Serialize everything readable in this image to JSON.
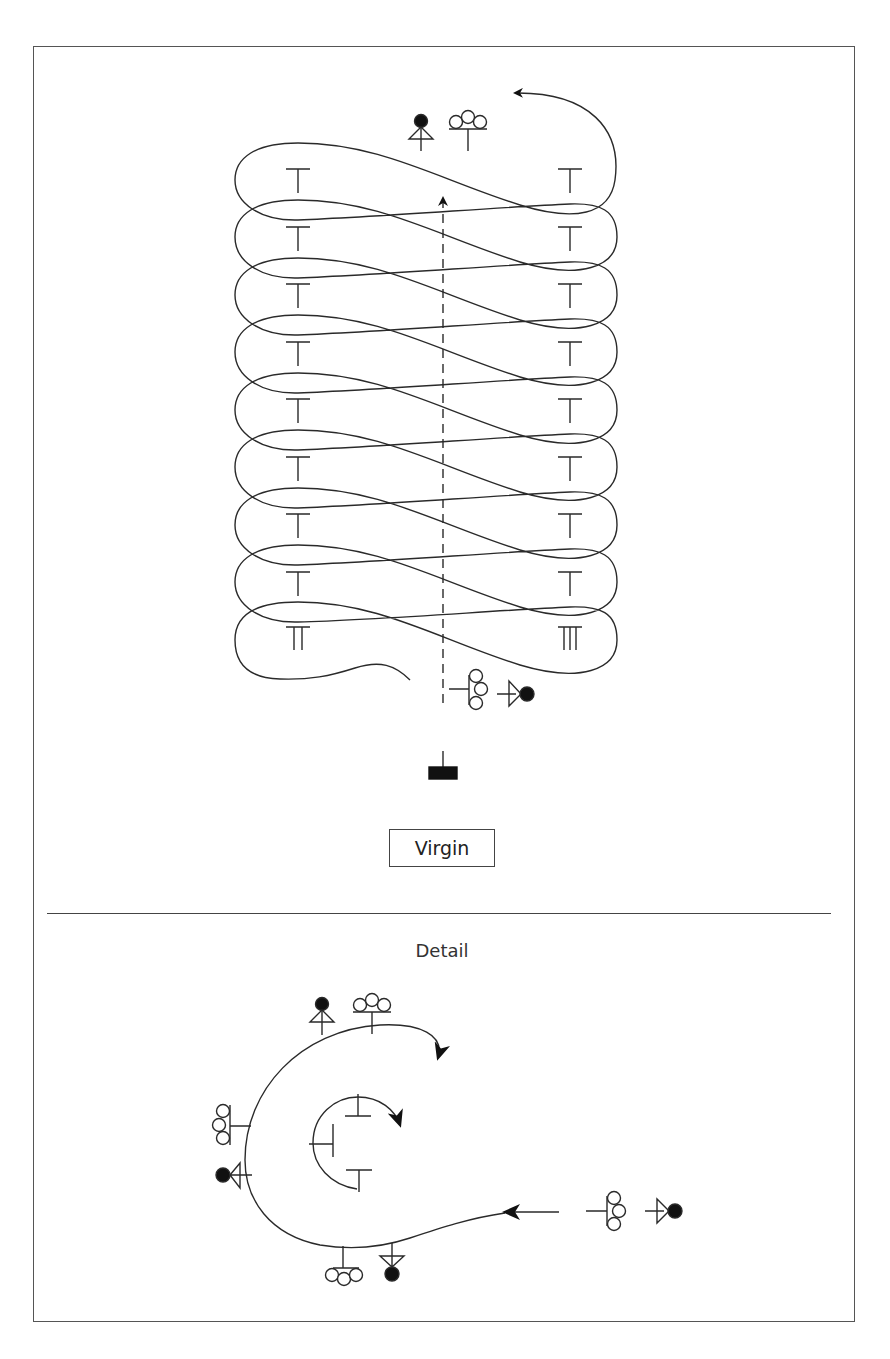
{
  "diagram": {
    "title_label": "Virgin",
    "detail_label": "Detail",
    "colors": {
      "stroke": "#2a2a2a",
      "frame": "#555555",
      "fill_dark": "#111111",
      "background": "#ffffff"
    },
    "main_pattern": {
      "type": "figure-eight spiral, 9 bands, ascending",
      "band_count": 9,
      "left_markers": [
        "T",
        "T",
        "T",
        "T",
        "T",
        "T",
        "T",
        "T",
        "TT"
      ],
      "right_markers": [
        "T",
        "T",
        "T",
        "T",
        "T",
        "T",
        "T",
        "T",
        "TTT"
      ],
      "center_line": "dashed, upward arrow",
      "top_symbols": [
        "filled-circle-on-triangle",
        "three-circles-on-stem"
      ],
      "bottom_symbols": [
        "three-circles-stacked-with-stem",
        "triangle-with-filled-circle"
      ],
      "base_symbol": "filled-rectangle-on-stem"
    },
    "detail_pattern": {
      "outer_symbols": [
        "filled-circle-on-triangle",
        "three-circles-on-stem",
        "three-circles-stacked",
        "triangle-with-filled-circle",
        "three-circles-on-stem",
        "triangle-with-filled-circle"
      ],
      "inner_markers": [
        "T",
        "T",
        "T"
      ],
      "entry_symbols": [
        "three-circles-stacked-with-stem",
        "triangle-with-filled-circle"
      ]
    }
  }
}
